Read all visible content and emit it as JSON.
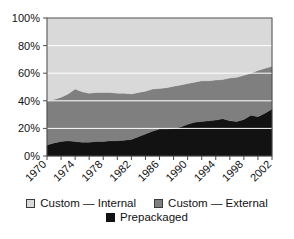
{
  "chart_data": {
    "type": "area",
    "stacked": true,
    "title": "",
    "subtitle": "",
    "xlabel": "",
    "ylabel": "",
    "xlim": [
      1970,
      2002
    ],
    "ylim": [
      0,
      100
    ],
    "y_tick_labels": [
      "0%",
      "20%",
      "40%",
      "60%",
      "80%",
      "100%"
    ],
    "y_tick_values": [
      0,
      20,
      40,
      60,
      80,
      100
    ],
    "x_tick_labels": [
      "1970",
      "1974",
      "1978",
      "1982",
      "1986",
      "1990",
      "1994",
      "1998",
      "2002"
    ],
    "x_tick_values": [
      1970,
      1974,
      1978,
      1982,
      1986,
      1990,
      1994,
      1998,
      2002
    ],
    "x_minor_tick_interval": 2,
    "grid": "horizontal-white",
    "legend_position": "bottom",
    "x": [
      1970,
      1971,
      1972,
      1973,
      1974,
      1975,
      1976,
      1977,
      1978,
      1979,
      1980,
      1981,
      1982,
      1983,
      1984,
      1985,
      1986,
      1987,
      1988,
      1989,
      1990,
      1991,
      1992,
      1993,
      1994,
      1995,
      1996,
      1997,
      1998,
      1999,
      2000,
      2001,
      2002
    ],
    "series": [
      {
        "name": "Prepackaged",
        "color": "#121212",
        "values": [
          8,
          9.5,
          10.5,
          11,
          10.5,
          10,
          10,
          10.5,
          10.5,
          11,
          11,
          11.5,
          12,
          14,
          16,
          18,
          19.5,
          19.5,
          20,
          21,
          23,
          24.5,
          25,
          25.5,
          26,
          27,
          25.5,
          25,
          26.5,
          29.5,
          28.5,
          31,
          34
        ]
      },
      {
        "name": "Custom — External",
        "color": "#7f7f7f",
        "values": [
          32,
          31.5,
          32,
          34,
          38,
          36.5,
          35.5,
          35.5,
          35.5,
          35,
          34.5,
          34,
          33,
          32,
          31,
          30.5,
          29.5,
          30,
          30.5,
          30.5,
          29.5,
          29,
          29.5,
          29,
          29,
          28.5,
          31,
          32,
          32,
          30.5,
          33.5,
          32.5,
          31
        ]
      },
      {
        "name": "Custom — Internal",
        "color": "#d9d9d9",
        "values": [
          60,
          59,
          57.5,
          55,
          51.5,
          53.5,
          54.5,
          54,
          54,
          54,
          54.5,
          54.5,
          55,
          54,
          53,
          51.5,
          51,
          50.5,
          49.5,
          48.5,
          47.5,
          46.5,
          45.5,
          45.5,
          45,
          44.5,
          43.5,
          43,
          41.5,
          40,
          38,
          36.5,
          35
        ]
      }
    ],
    "cumulative_top_boundaries": {
      "prepackaged_top": [
        8,
        9.5,
        10.5,
        11,
        10.5,
        10,
        10,
        10.5,
        10.5,
        11,
        11,
        11.5,
        12,
        14,
        16,
        18,
        19.5,
        19.5,
        20,
        21,
        23,
        24.5,
        25,
        25.5,
        26,
        27,
        25.5,
        25,
        26.5,
        29.5,
        28.5,
        31,
        34
      ],
      "custom_external_top": [
        40,
        41,
        42.5,
        45,
        48.5,
        46.5,
        45.5,
        46,
        46,
        46,
        45.5,
        45.5,
        45,
        46,
        47,
        48.5,
        49,
        49.5,
        50.5,
        51.5,
        52.5,
        53.5,
        54.5,
        54.5,
        55,
        55.5,
        56.5,
        57,
        58.5,
        60,
        62,
        63.5,
        65
      ]
    }
  },
  "legend": {
    "items": [
      {
        "label": "Custom — Internal",
        "color": "#d9d9d9",
        "swatch": "legend-swatch-custom-internal"
      },
      {
        "label": "Custom — External",
        "color": "#7f7f7f",
        "swatch": "legend-swatch-custom-external"
      },
      {
        "label": "Prepackaged",
        "color": "#121212",
        "swatch": "legend-swatch-prepackaged"
      }
    ]
  },
  "colors": {
    "custom_internal": "#d9d9d9",
    "custom_external": "#7f7f7f",
    "prepackaged": "#121212",
    "gridline": "#ffffff",
    "axis": "#4a4a4a",
    "text": "#111111",
    "background": "#ffffff"
  }
}
